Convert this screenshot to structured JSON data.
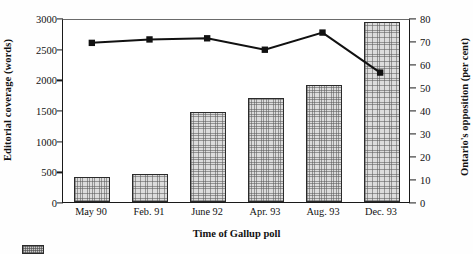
{
  "chart_data": {
    "type": "bar",
    "title": "",
    "xlabel": "Time of Gallup poll",
    "ylabel": "Editorial coverage (words)",
    "ylabel_right": "Ontario's opposition (per cent)",
    "categories": [
      "May 90",
      "Feb. 91",
      "June 92",
      "Apr. 93",
      "Aug. 93",
      "Dec. 93"
    ],
    "ylim": [
      0,
      3000
    ],
    "ylim_right": [
      0,
      80
    ],
    "yticks": [
      0,
      500,
      1000,
      1500,
      2000,
      2500,
      3000
    ],
    "yticks_right": [
      0,
      10,
      20,
      30,
      40,
      50,
      60,
      70,
      80
    ],
    "grid": false,
    "legend_position": "below",
    "series": [
      {
        "name": "Editorial coverage (words)",
        "type": "bar",
        "axis": "left",
        "values": [
          400,
          455,
          1465,
          1700,
          1910,
          2930
        ]
      },
      {
        "name": "Ontario's opposition (per cent)",
        "type": "line",
        "axis": "right",
        "marker": "square",
        "values": [
          70,
          71.5,
          72,
          67,
          74.5,
          57
        ]
      }
    ]
  },
  "legend": {
    "items": [
      {
        "label": "",
        "swatch": "bar-hatch-swatch"
      }
    ]
  }
}
